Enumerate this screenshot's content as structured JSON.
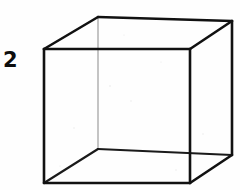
{
  "figure": {
    "label": "2",
    "caption_number": "2",
    "kind": "wireframe-cube-line-drawing",
    "background_color": "#fefefe",
    "ink_color": "#111111",
    "faint_edge_color": "#8a8a8a",
    "canvas": {
      "width": 240,
      "height": 190
    }
  },
  "chart_data": {
    "type": "diagram",
    "title": "2",
    "shape": "cube",
    "projection": "oblique-parallel",
    "vertices": {
      "front_top_left": [
        44,
        49
      ],
      "front_top_right": [
        190,
        49
      ],
      "front_bottom_right": [
        190,
        183
      ],
      "front_bottom_left": [
        44,
        183
      ],
      "rear_top_left": [
        98,
        17
      ],
      "rear_top_right": [
        232,
        21
      ],
      "rear_bottom_right": [
        232,
        155
      ],
      "rear_bottom_left": [
        98,
        149
      ]
    },
    "edges": [
      {
        "name": "front-top",
        "from": "front_top_left",
        "to": "front_top_right",
        "weight": "bold"
      },
      {
        "name": "front-right",
        "from": "front_top_right",
        "to": "front_bottom_right",
        "weight": "bold"
      },
      {
        "name": "front-bottom",
        "from": "front_bottom_right",
        "to": "front_bottom_left",
        "weight": "bold"
      },
      {
        "name": "front-left",
        "from": "front_bottom_left",
        "to": "front_top_left",
        "weight": "bold"
      },
      {
        "name": "rear-top",
        "from": "rear_top_left",
        "to": "rear_top_right",
        "weight": "bold"
      },
      {
        "name": "rear-right",
        "from": "rear_top_right",
        "to": "rear_bottom_right",
        "weight": "bold"
      },
      {
        "name": "rear-bottom",
        "from": "rear_bottom_right",
        "to": "rear_bottom_left",
        "weight": "medium"
      },
      {
        "name": "rear-left",
        "from": "rear_bottom_left",
        "to": "rear_top_left",
        "weight": "thin"
      },
      {
        "name": "connector-top-left",
        "from": "front_top_left",
        "to": "rear_top_left",
        "weight": "bold"
      },
      {
        "name": "connector-top-right",
        "from": "front_top_right",
        "to": "rear_top_right",
        "weight": "bold"
      },
      {
        "name": "connector-bottom-right",
        "from": "front_bottom_right",
        "to": "rear_bottom_right",
        "weight": "bold"
      },
      {
        "name": "connector-bottom-left",
        "from": "front_bottom_left",
        "to": "rear_bottom_left",
        "weight": "medium"
      }
    ],
    "xlabel": "",
    "ylabel": "",
    "grid": false,
    "legend": false
  }
}
